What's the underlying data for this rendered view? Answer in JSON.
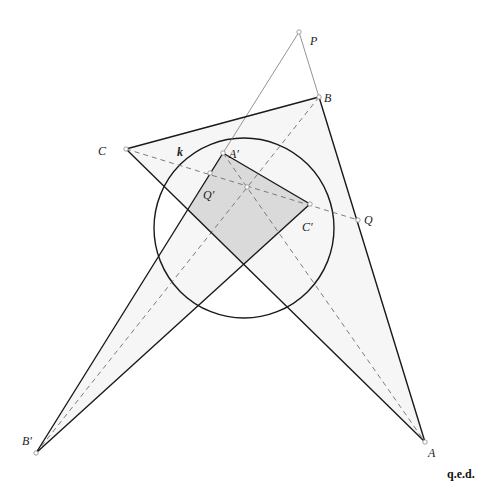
{
  "figure": {
    "points": {
      "P": {
        "x": 299,
        "y": 32
      },
      "B": {
        "x": 319,
        "y": 97
      },
      "C": {
        "x": 126,
        "y": 149
      },
      "A": {
        "x": 425,
        "y": 442
      },
      "Bp": {
        "x": 36,
        "y": 453
      },
      "Ap": {
        "x": 223,
        "y": 153
      },
      "Cp": {
        "x": 310,
        "y": 204
      },
      "Q": {
        "x": 358,
        "y": 220
      },
      "Qp": {
        "x": 210,
        "y": 173
      },
      "O": {
        "x": 247,
        "y": 187
      }
    },
    "circle_k": {
      "cx": 244,
      "cy": 228,
      "r": 90
    },
    "fills": [
      {
        "name": "triangle-abc-fill",
        "pts": [
          "A",
          "B",
          "C"
        ],
        "color": "#f6f6f6"
      },
      {
        "name": "triangle-a-b-c-prime-fill",
        "pts": [
          "Ap",
          "Bp",
          "Cp"
        ],
        "color": "#f6f6f6"
      },
      {
        "name": "intersection-quad-fill",
        "coords": [
          [
            223,
            153
          ],
          [
            310,
            204
          ],
          [
            244,
            264
          ],
          [
            188,
            211
          ]
        ],
        "color": "#dadada"
      }
    ],
    "thick_lines": [
      [
        "C",
        "B"
      ],
      [
        "B",
        "A"
      ],
      [
        "A",
        "C"
      ],
      [
        "Bp",
        "Ap"
      ],
      [
        "Ap",
        "Cp"
      ],
      [
        "Cp",
        "Bp"
      ]
    ],
    "thin_lines": [
      [
        "P",
        "B"
      ],
      [
        "P",
        "Ap"
      ]
    ],
    "dashed_lines": [
      [
        "C",
        "Q"
      ],
      [
        "B",
        "Bp"
      ],
      [
        "Ap",
        "A"
      ]
    ],
    "markers": [
      "P",
      "B",
      "C",
      "A",
      "Bp",
      "Ap",
      "Cp",
      "Q",
      "Qp",
      "O"
    ],
    "labels": [
      {
        "text": "P",
        "x": 310,
        "y": 45,
        "bold": false
      },
      {
        "text": "B",
        "x": 324,
        "y": 102,
        "bold": false
      },
      {
        "text": "C",
        "x": 98,
        "y": 155,
        "bold": false
      },
      {
        "text": "k",
        "x": 177,
        "y": 156,
        "bold": true
      },
      {
        "text": "A′",
        "x": 229,
        "y": 158,
        "bold": false
      },
      {
        "text": "Q′",
        "x": 203,
        "y": 199,
        "bold": false
      },
      {
        "text": "C′",
        "x": 302,
        "y": 231,
        "bold": false
      },
      {
        "text": "Q",
        "x": 364,
        "y": 224,
        "bold": false
      },
      {
        "text": "B′",
        "x": 22,
        "y": 445,
        "bold": false
      },
      {
        "text": "A",
        "x": 428,
        "y": 457,
        "bold": false
      }
    ],
    "colors": {
      "thick": "#1a1a1a",
      "thin": "#666666",
      "dashed": "#6e6e6e",
      "circle": "#1a1a1a",
      "marker_stroke": "#8a8a8a"
    }
  },
  "footer": {
    "qed": "q.e.d."
  }
}
